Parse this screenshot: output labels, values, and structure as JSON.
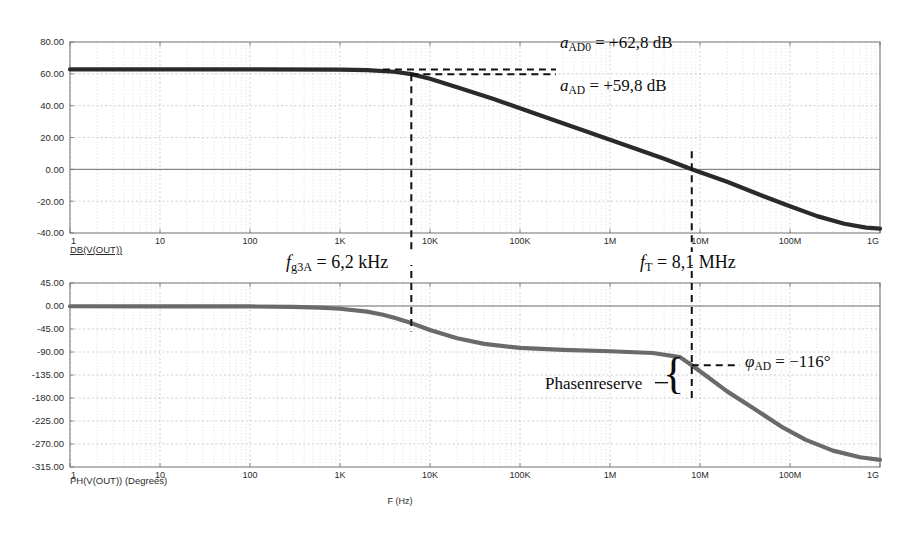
{
  "figure": {
    "background": "#ffffff",
    "frame_color": "#707070",
    "grid_color": "#b9b9b9"
  },
  "chart_data": [
    {
      "type": "line",
      "title": "",
      "panel": "magnitude",
      "xlabel": "",
      "ylabel": "",
      "trace_label": "DB(V(OUT))",
      "xscale": "log",
      "xlim": [
        1,
        1000000000
      ],
      "ylim": [
        -40,
        80
      ],
      "grid": true,
      "trace_color": "#2a2a2a",
      "xticks": [
        1,
        10,
        100,
        1000,
        10000,
        100000,
        1000000,
        10000000,
        100000000,
        1000000000
      ],
      "xticklabels": [
        "1",
        "10",
        "100",
        "1K",
        "10K",
        "100K",
        "1M",
        "10M",
        "100M",
        "1G"
      ],
      "yticks": [
        80,
        60,
        40,
        20,
        0,
        -20,
        -40
      ],
      "yticklabels": [
        "80.00",
        "60.00",
        "40.00",
        "20.00",
        "0.00",
        "-20.00",
        "-40.00"
      ],
      "x": [
        1,
        10,
        100,
        1000,
        2000,
        4000,
        6200,
        10000,
        20000,
        50000,
        100000,
        200000,
        500000,
        1000000,
        2000000,
        4000000,
        8100000,
        20000000,
        50000000,
        100000000,
        200000000,
        400000000,
        700000000,
        1000000000
      ],
      "y": [
        62.8,
        62.8,
        62.8,
        62.6,
        62.3,
        61.3,
        59.8,
        56.9,
        51.6,
        44.3,
        38.4,
        32.4,
        24.6,
        18.6,
        12.6,
        6.6,
        0.0,
        -7.8,
        -16.8,
        -23.2,
        -29.4,
        -34.2,
        -36.6,
        -37.2
      ]
    },
    {
      "type": "line",
      "title": "",
      "panel": "phase",
      "xlabel": "F (Hz)",
      "ylabel": "",
      "trace_label": "PH(V(OUT)) (Degrees)",
      "xscale": "log",
      "xlim": [
        1,
        1000000000
      ],
      "ylim": [
        -315,
        45
      ],
      "grid": true,
      "trace_color": "#6a6a6a",
      "xticks": [
        1,
        10,
        100,
        1000,
        10000,
        100000,
        1000000,
        10000000,
        100000000,
        1000000000
      ],
      "xticklabels": [
        "1",
        "10",
        "100",
        "1K",
        "10K",
        "100K",
        "1M",
        "10M",
        "100M",
        "1G"
      ],
      "yticks": [
        45,
        0,
        -45,
        -90,
        -135,
        -180,
        -225,
        -270,
        -315
      ],
      "yticklabels": [
        "45.00",
        "0.00",
        "-45.00",
        "-90.00",
        "-135.00",
        "-180.00",
        "-225.00",
        "-270.00",
        "-315.00"
      ],
      "x": [
        1,
        10,
        100,
        300,
        600,
        1000,
        2000,
        3000,
        4000,
        6200,
        10000,
        20000,
        40000,
        100000,
        300000,
        1000000,
        3000000,
        6000000,
        8100000,
        12000000,
        20000000,
        40000000,
        80000000,
        150000000,
        300000000,
        600000000,
        1000000000
      ],
      "y": [
        -0.5,
        -0.6,
        -0.9,
        -1.6,
        -3.2,
        -5.4,
        -11.0,
        -17.0,
        -23.0,
        -33.5,
        -47.0,
        -63.0,
        -74.0,
        -82.0,
        -86.0,
        -88.5,
        -92.0,
        -100.0,
        -116.0,
        -138.0,
        -167.0,
        -201.0,
        -236.0,
        -262.0,
        -283.0,
        -296.0,
        -301.0
      ]
    }
  ],
  "annotations": {
    "magnitude": [
      {
        "id": "a-ad0",
        "sym": "a",
        "sub": "AD0",
        "value": "= +62,8 dB"
      },
      {
        "id": "a-ad",
        "sym": "a",
        "sub": "AD",
        "value": "= +59,8 dB"
      }
    ],
    "frequency": [
      {
        "id": "f-g3a",
        "sym": "f",
        "sub": "g3A",
        "value": "= 6,2 kHz"
      },
      {
        "id": "f-t",
        "sym": "f",
        "sub": "T",
        "value": "= 8,1 MHz"
      }
    ],
    "phase": [
      {
        "id": "phi-ad",
        "sym": "φ",
        "sub": "AD",
        "value": "= −116°"
      }
    ],
    "brace_label": "Phasenreserve"
  },
  "markers": {
    "f_g3A_hz": 6200,
    "f_T_hz": 8100000,
    "a_AD0_db": 62.8,
    "a_AD_db": 59.8,
    "phi_AD_deg": -116,
    "phase_reserve_from_deg": -116,
    "phase_reserve_to_deg": -180
  }
}
